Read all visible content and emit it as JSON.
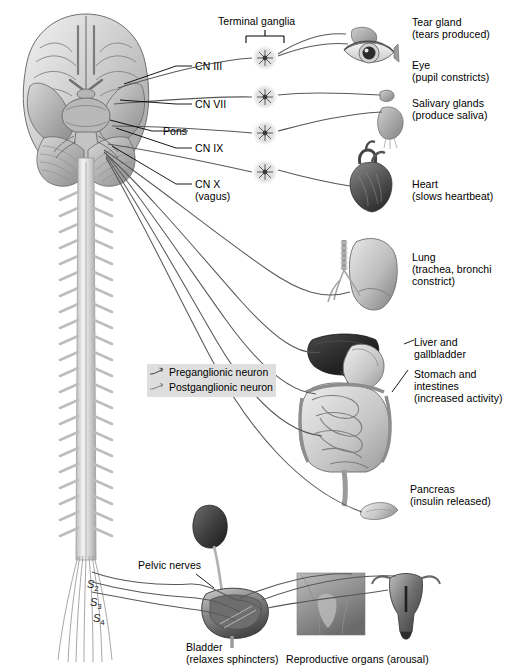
{
  "figure": {
    "background_color": "#ffffff",
    "ink_color": "#3a3a3a",
    "text_color": "#000000",
    "legend_background": "#dedede"
  },
  "annotations": {
    "terminal_ganglia": "Terminal ganglia",
    "pelvic_nerves": "Pelvic nerves"
  },
  "cranial_nerves": [
    {
      "id": "cn3",
      "label": "CN III"
    },
    {
      "id": "cn7",
      "label": "CN VII"
    },
    {
      "id": "pons",
      "label": "Pons"
    },
    {
      "id": "cn9",
      "label": "CN IX"
    },
    {
      "id": "cn10",
      "label": "CN X",
      "label2": "(vagus)"
    }
  ],
  "sacral_nerves": [
    {
      "label": "S",
      "subscript": "2"
    },
    {
      "label": "S",
      "subscript": "3"
    },
    {
      "label": "S",
      "subscript": "4"
    }
  ],
  "legend": {
    "items": [
      {
        "name": "Preganglionic neuron",
        "glyph": "preganglionic-neuron-glyph"
      },
      {
        "name": "Postganglionic neuron",
        "glyph": "postganglionic-neuron-glyph"
      }
    ]
  },
  "organs": [
    {
      "id": "tear-gland",
      "name": "Tear gland",
      "effect": "(tears produced)"
    },
    {
      "id": "eye",
      "name": "Eye",
      "effect": "(pupil constricts)"
    },
    {
      "id": "salivary-glands",
      "name": "Salivary glands",
      "effect": "(produce saliva)"
    },
    {
      "id": "heart",
      "name": "Heart",
      "effect": "(slows heartbeat)"
    },
    {
      "id": "lung",
      "name": "Lung",
      "effect": "(trachea, bronchi",
      "effect2": "constrict)"
    },
    {
      "id": "liver",
      "name": "Liver and",
      "name2": "gallbladder"
    },
    {
      "id": "stomach",
      "name": "Stomach and",
      "name2": "intestines",
      "effect": "(increased activity)"
    },
    {
      "id": "pancreas",
      "name": "Pancreas",
      "effect": "(insulin released)"
    },
    {
      "id": "bladder",
      "name": "Bladder",
      "effect": "(relaxes sphincters)"
    },
    {
      "id": "reproductive",
      "name": "Reproductive organs (arousal)"
    }
  ]
}
